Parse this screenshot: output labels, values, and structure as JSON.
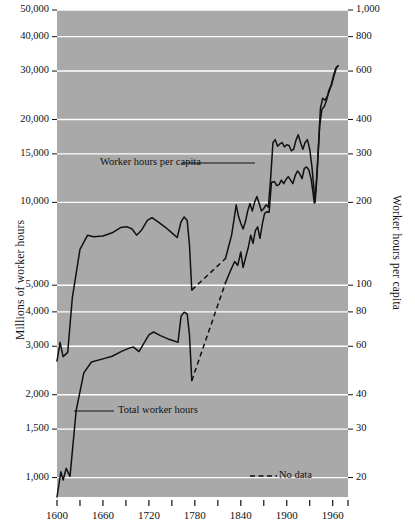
{
  "chart_data": {
    "type": "line",
    "title": "",
    "background_color": "#a9a9a9",
    "line_color": "#111111",
    "gridline_color": "#ffffff",
    "xlabel": "",
    "xlim": [
      1600,
      1980
    ],
    "x_major_ticks": [
      1600,
      1660,
      1720,
      1780,
      1840,
      1900,
      1960
    ],
    "x_minor_ticks": [
      1630,
      1690,
      1750,
      1810,
      1870,
      1930,
      1980
    ],
    "x_tick_labels": [
      "1600",
      "1660",
      "1720",
      "1780",
      "1840",
      "1900",
      "1960"
    ],
    "left_axis": {
      "label": "Millions of worker hours",
      "scale": "log",
      "lim": [
        850,
        50000
      ],
      "ticks": [
        1000,
        1500,
        2000,
        3000,
        4000,
        5000,
        10000,
        15000,
        20000,
        30000,
        40000,
        50000
      ],
      "tick_labels": [
        "1,000",
        "1,500",
        "2,000",
        "3,000",
        "4,000",
        "5,000",
        "10,000",
        "15,000",
        "20,000",
        "30,000",
        "40,000",
        "50,000"
      ]
    },
    "right_axis": {
      "label": "Worker hours per capita",
      "scale": "log",
      "lim": [
        17,
        1000
      ],
      "ticks": [
        20,
        30,
        40,
        60,
        80,
        100,
        200,
        300,
        400,
        600,
        800,
        1000
      ],
      "tick_labels": [
        "20",
        "30",
        "40",
        "60",
        "80",
        "100",
        "200",
        "300",
        "400",
        "600",
        "800",
        "1,000"
      ]
    },
    "legend": {
      "position": "bottom-center",
      "entries": [
        {
          "label": "No data",
          "style": "dashed"
        }
      ]
    },
    "annotations": [
      {
        "text": "Worker hours per capita",
        "series": "worker_hours_per_capita"
      },
      {
        "text": "Total worker hours",
        "series": "total_worker_hours"
      }
    ],
    "series": [
      {
        "name": "Total worker hours",
        "axis": "left",
        "units": "millions of worker hours",
        "solid_segments": [
          [
            [
              1600,
              850
            ],
            [
              1605,
              1050
            ],
            [
              1608,
              980
            ],
            [
              1612,
              1080
            ],
            [
              1617,
              1010
            ],
            [
              1625,
              1750
            ],
            [
              1635,
              2400
            ],
            [
              1645,
              2630
            ],
            [
              1660,
              2700
            ],
            [
              1672,
              2760
            ],
            [
              1685,
              2880
            ],
            [
              1695,
              2960
            ],
            [
              1700,
              2980
            ],
            [
              1707,
              2870
            ],
            [
              1713,
              3060
            ],
            [
              1720,
              3300
            ],
            [
              1726,
              3380
            ],
            [
              1735,
              3280
            ],
            [
              1745,
              3190
            ],
            [
              1752,
              3140
            ],
            [
              1758,
              3100
            ],
            [
              1762,
              3860
            ],
            [
              1766,
              3990
            ],
            [
              1770,
              3930
            ],
            [
              1773,
              3300
            ],
            [
              1776,
              2250
            ]
          ],
          [
            [
              1820,
              5100
            ],
            [
              1826,
              5600
            ],
            [
              1832,
              6100
            ],
            [
              1836,
              5900
            ],
            [
              1840,
              6600
            ],
            [
              1843,
              5800
            ],
            [
              1846,
              6250
            ],
            [
              1850,
              6900
            ],
            [
              1853,
              7600
            ],
            [
              1856,
              7100
            ],
            [
              1859,
              7900
            ],
            [
              1862,
              8150
            ],
            [
              1865,
              7400
            ],
            [
              1868,
              8300
            ],
            [
              1871,
              9100
            ],
            [
              1874,
              9250
            ],
            [
              1877,
              9200
            ],
            [
              1880,
              11800
            ],
            [
              1884,
              11900
            ],
            [
              1887,
              11500
            ],
            [
              1890,
              11600
            ],
            [
              1893,
              12050
            ],
            [
              1896,
              11700
            ],
            [
              1899,
              12100
            ],
            [
              1902,
              12400
            ],
            [
              1905,
              12050
            ],
            [
              1908,
              11700
            ],
            [
              1911,
              12500
            ],
            [
              1914,
              13000
            ],
            [
              1917,
              12700
            ],
            [
              1920,
              12200
            ],
            [
              1923,
              13300
            ],
            [
              1926,
              13450
            ],
            [
              1929,
              13100
            ],
            [
              1932,
              12100
            ],
            [
              1934,
              11000
            ],
            [
              1936,
              9950
            ],
            [
              1938,
              11200
            ],
            [
              1940,
              13500
            ],
            [
              1943,
              19000
            ],
            [
              1946,
              21800
            ],
            [
              1949,
              22300
            ],
            [
              1952,
              23500
            ],
            [
              1955,
              25500
            ],
            [
              1958,
              26600
            ],
            [
              1961,
              28800
            ],
            [
              1964,
              30700
            ],
            [
              1967,
              31300
            ]
          ]
        ],
        "dashed_segments": [
          [
            [
              1776,
              2250
            ],
            [
              1820,
              5100
            ]
          ]
        ]
      },
      {
        "name": "Worker hours per capita",
        "axis": "right",
        "units": "worker hours per capita",
        "solid_segments": [
          [
            [
              1600,
              53
            ],
            [
              1604,
              62
            ],
            [
              1608,
              55
            ],
            [
              1614,
              57
            ],
            [
              1620,
              90
            ],
            [
              1630,
              135
            ],
            [
              1640,
              152
            ],
            [
              1648,
              150
            ],
            [
              1660,
              151
            ],
            [
              1672,
              155
            ],
            [
              1683,
              162
            ],
            [
              1692,
              163
            ],
            [
              1698,
              160
            ],
            [
              1704,
              152
            ],
            [
              1710,
              158
            ],
            [
              1718,
              172
            ],
            [
              1724,
              176
            ],
            [
              1732,
              170
            ],
            [
              1742,
              162
            ],
            [
              1750,
              155
            ],
            [
              1757,
              149
            ],
            [
              1762,
              170
            ],
            [
              1766,
              177
            ],
            [
              1770,
              172
            ],
            [
              1773,
              140
            ],
            [
              1776,
              96
            ]
          ],
          [
            [
              1820,
              125
            ],
            [
              1824,
              138
            ],
            [
              1828,
              152
            ],
            [
              1831,
              172
            ],
            [
              1834,
              196
            ],
            [
              1837,
              178
            ],
            [
              1840,
              168
            ],
            [
              1843,
              160
            ],
            [
              1846,
              170
            ],
            [
              1849,
              186
            ],
            [
              1852,
              198
            ],
            [
              1855,
              186
            ],
            [
              1858,
              200
            ],
            [
              1861,
              210
            ],
            [
              1864,
              198
            ],
            [
              1867,
              186
            ],
            [
              1870,
              190
            ],
            [
              1873,
              196
            ],
            [
              1876,
              192
            ],
            [
              1879,
              245
            ],
            [
              1882,
              330
            ],
            [
              1885,
              338
            ],
            [
              1888,
              320
            ],
            [
              1891,
              326
            ],
            [
              1894,
              330
            ],
            [
              1897,
              318
            ],
            [
              1900,
              324
            ],
            [
              1903,
              322
            ],
            [
              1906,
              308
            ],
            [
              1909,
              312
            ],
            [
              1912,
              336
            ],
            [
              1915,
              352
            ],
            [
              1918,
              330
            ],
            [
              1921,
              312
            ],
            [
              1924,
              330
            ],
            [
              1927,
              338
            ],
            [
              1930,
              312
            ],
            [
              1933,
              268
            ],
            [
              1935,
              232
            ],
            [
              1937,
              200
            ],
            [
              1939,
              238
            ],
            [
              1941,
              300
            ],
            [
              1944,
              440
            ],
            [
              1947,
              478
            ],
            [
              1950,
              470
            ],
            [
              1953,
              485
            ],
            [
              1956,
              512
            ],
            [
              1959,
              540
            ],
            [
              1962,
              580
            ],
            [
              1965,
              618
            ],
            [
              1967,
              628
            ]
          ]
        ],
        "dashed_segments": [
          [
            [
              1776,
              96
            ],
            [
              1820,
              125
            ]
          ]
        ]
      }
    ]
  }
}
